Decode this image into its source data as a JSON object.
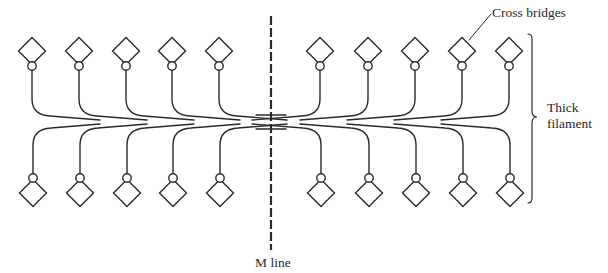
{
  "diagram": {
    "labels": {
      "cross_bridges": "Cross bridges",
      "thick_filament_line1": "Thick",
      "thick_filament_line2": "filament",
      "m_line": "M line"
    },
    "colors": {
      "stroke": "#2a2a2a",
      "background": "#ffffff"
    },
    "m_line": {
      "x": 271,
      "y_top": 16,
      "y_bottom": 250
    },
    "top_row_y": {
      "diamond_center": 51,
      "circle_center": 66
    },
    "bottom_row_y": {
      "diamond_center": 193,
      "circle_center": 178
    },
    "left_heads_x": [
      32,
      79,
      126,
      172,
      219
    ],
    "right_heads_x": [
      320,
      368,
      415,
      462,
      509
    ],
    "bracket": {
      "x": 532,
      "y_top": 34,
      "y_bottom": 203,
      "mid_y": 117
    }
  }
}
